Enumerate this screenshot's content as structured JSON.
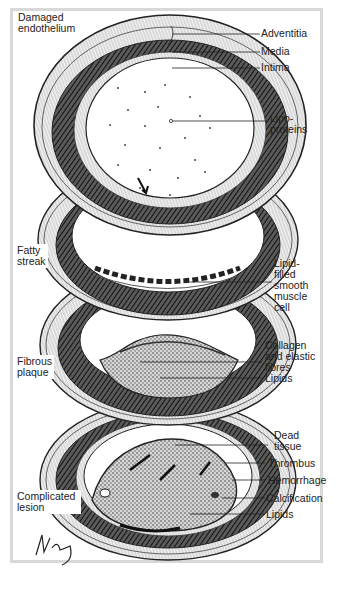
{
  "figure": {
    "stages": [
      {
        "id": "damaged-endothelium",
        "label": "Damaged\nendothelium",
        "annotations": [
          "Adventitia",
          "Media",
          "Intima",
          "Lipo-\nproteins"
        ]
      },
      {
        "id": "fatty-streak",
        "label": "Fatty\nstreak",
        "annotations": [
          "Lipid-\nfilled\nsmooth\nmuscle\ncell"
        ]
      },
      {
        "id": "fibrous-plaque",
        "label": "Fibrous\nplaque",
        "annotations": [
          "Collagen\nand elastic\nfibres",
          "Lipids"
        ]
      },
      {
        "id": "complicated-lesion",
        "label": "Complicated\nlesion",
        "annotations": [
          "Dead\ntissue",
          "Thrombus",
          "Hemorrhage",
          "Calcification",
          "Lipids"
        ]
      }
    ],
    "labels": {
      "damaged_endothelium_1": "Damaged",
      "damaged_endothelium_2": "endothelium",
      "adventitia": "Adventitia",
      "media": "Media",
      "intima": "Intima",
      "lipoproteins_1": "Lipo-",
      "lipoproteins_2": "proteins",
      "fatty_streak_1": "Fatty",
      "fatty_streak_2": "streak",
      "lipid_filled_1": "Lipid-",
      "lipid_filled_2": "filled",
      "lipid_filled_3": "smooth",
      "lipid_filled_4": "muscle",
      "lipid_filled_5": "cell",
      "fibrous_plaque_1": "Fibrous",
      "fibrous_plaque_2": "plaque",
      "collagen_1": "Collagen",
      "collagen_2": "and elastic",
      "collagen_3": "fibres",
      "lipids_plaque": "Lipids",
      "dead_tissue_1": "Dead",
      "dead_tissue_2": "tissue",
      "thrombus": "Thrombus",
      "hemorrhage": "Hemorrhage",
      "calcification": "Calcification",
      "lipids_lesion": "Lipids",
      "complicated_1": "Complicated",
      "complicated_2": "lesion"
    },
    "signature": "artist signature",
    "colors": {
      "frame": "#d8d8d8",
      "ink": "#1a1a1a",
      "media_dark": "#3a3a3a",
      "lumen": "#ffffff"
    }
  }
}
